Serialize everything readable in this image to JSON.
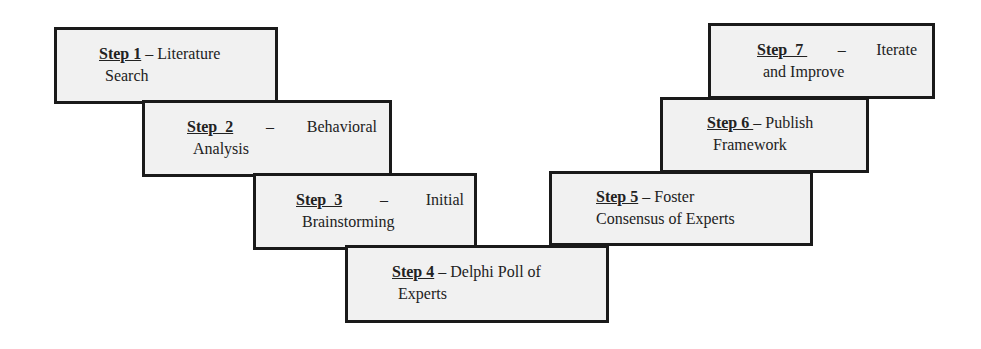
{
  "diagram": {
    "type": "v-shaped process flow",
    "steps": [
      {
        "label": "Step 1",
        "sep": " – ",
        "title_l1": "Literature",
        "title_l2": "Search"
      },
      {
        "label": "Step  2",
        "sep": " – ",
        "title_l1": "Behavioral",
        "title_l2": "Analysis"
      },
      {
        "label": "Step  3",
        "sep": " – ",
        "title_l1": "Initial",
        "title_l2": "Brainstorming"
      },
      {
        "label": "Step 4",
        "sep": " – ",
        "title_l1": "Delphi Poll of",
        "title_l2": "Experts"
      },
      {
        "label": "Step 5",
        "sep": " – ",
        "title_l1": "Foster",
        "title_l2": "Consensus of Experts"
      },
      {
        "label": "Step 6 ",
        "sep": "– ",
        "title_l1": "Publish",
        "title_l2": "Framework"
      },
      {
        "label": "Step  7 ",
        "sep": " – ",
        "title_l1": "Iterate",
        "title_l2": "and Improve"
      }
    ]
  },
  "colors": {
    "border": "#1a1a1a",
    "fill": "#f1f1f1",
    "text": "#222222"
  }
}
